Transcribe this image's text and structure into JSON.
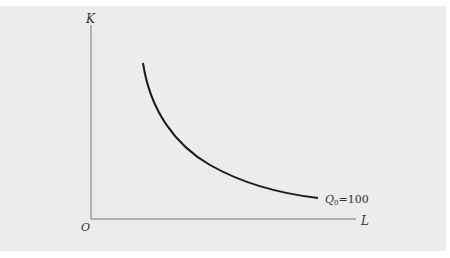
{
  "diagram": {
    "type": "isoquant",
    "axes": {
      "y_label": "K",
      "x_label": "L",
      "origin_label": "O"
    },
    "curve": {
      "label_var": "Q",
      "label_sub": "0",
      "label_value": "=100"
    },
    "colors": {
      "background": "#ececec",
      "axis": "#666666",
      "curve": "#1a1a1a"
    }
  }
}
